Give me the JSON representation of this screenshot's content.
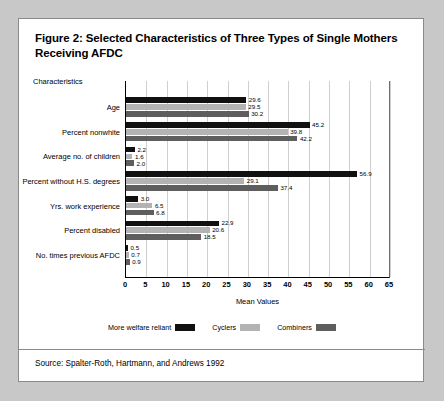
{
  "figure": {
    "title": "Figure 2: Selected Characteristics of Three Types of Single Mothers Receiving AFDC",
    "source": "Source: Spalter-Roth, Hartmann, and Andrews 1992",
    "axis_header": "Characteristics"
  },
  "chart_data": {
    "type": "bar",
    "orientation": "horizontal",
    "title": "Figure 2: Selected Characteristics of Three Types of Single Mothers Receiving AFDC",
    "xlabel": "Mean Values",
    "ylabel": "Characteristics",
    "xlim": [
      0,
      65
    ],
    "xticks": [
      0,
      5,
      10,
      15,
      20,
      25,
      30,
      35,
      40,
      45,
      50,
      55,
      60,
      65
    ],
    "grid": true,
    "legend_position": "bottom",
    "categories": [
      "Age",
      "Percent nonwhite",
      "Average no. of children",
      "Percent without H.S. degrees",
      "Yrs. work experience",
      "Percent disabled",
      "No. times previous AFDC"
    ],
    "series": [
      {
        "name": "More welfare reliant",
        "color": "#111111",
        "values": [
          29.6,
          45.2,
          2.2,
          56.9,
          3.0,
          22.9,
          0.5
        ]
      },
      {
        "name": "Cyclers",
        "color": "#b3b3b3",
        "values": [
          29.5,
          39.8,
          1.6,
          29.1,
          6.5,
          20.6,
          0.7
        ]
      },
      {
        "name": "Combiners",
        "color": "#5e5e5e",
        "values": [
          30.2,
          42.2,
          2.0,
          37.4,
          6.8,
          18.5,
          0.9
        ]
      }
    ]
  }
}
